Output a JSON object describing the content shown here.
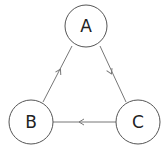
{
  "diagram": {
    "type": "directed-graph",
    "colors": {
      "node_stroke": "#555555",
      "edge_stroke": "#777777",
      "label": "#222222",
      "background": "#ffffff"
    },
    "nodes": [
      {
        "id": "A",
        "label": "A",
        "cx": 86,
        "cy": 26,
        "r": 21
      },
      {
        "id": "B",
        "label": "B",
        "cx": 31,
        "cy": 122,
        "r": 22
      },
      {
        "id": "C",
        "label": "C",
        "cx": 138,
        "cy": 122,
        "r": 22
      }
    ],
    "edges": [
      {
        "from": "A",
        "to": "C",
        "x1": 100,
        "y1": 46,
        "x2": 126,
        "y2": 102,
        "arrow_x": 111,
        "arrow_y": 73,
        "arrow_angle": 65
      },
      {
        "from": "C",
        "to": "B",
        "x1": 116,
        "y1": 122,
        "x2": 53,
        "y2": 122,
        "arrow_x": 80,
        "arrow_y": 122,
        "arrow_angle": 180
      },
      {
        "from": "B",
        "to": "A",
        "x1": 43,
        "y1": 102,
        "x2": 72,
        "y2": 46,
        "arrow_x": 60,
        "arrow_y": 70,
        "arrow_angle": -62
      }
    ]
  }
}
